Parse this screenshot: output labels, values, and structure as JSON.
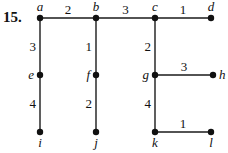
{
  "problem_number": "15.",
  "colors": {
    "stroke": "#1a1a1a",
    "node": "#111111",
    "background": "#ffffff"
  },
  "nodes": [
    {
      "id": "a",
      "label": "a",
      "x": 40,
      "y": 18,
      "label_pos": "above"
    },
    {
      "id": "b",
      "label": "b",
      "x": 96,
      "y": 18,
      "label_pos": "above"
    },
    {
      "id": "c",
      "label": "c",
      "x": 155,
      "y": 18,
      "label_pos": "above"
    },
    {
      "id": "d",
      "label": "d",
      "x": 211,
      "y": 18,
      "label_pos": "above"
    },
    {
      "id": "e",
      "label": "e",
      "x": 40,
      "y": 75,
      "label_pos": "left"
    },
    {
      "id": "f",
      "label": "f",
      "x": 96,
      "y": 75,
      "label_pos": "left"
    },
    {
      "id": "g",
      "label": "g",
      "x": 155,
      "y": 75,
      "label_pos": "left"
    },
    {
      "id": "h",
      "label": "h",
      "x": 213,
      "y": 75,
      "label_pos": "right"
    },
    {
      "id": "i",
      "label": "i",
      "x": 40,
      "y": 132,
      "label_pos": "below"
    },
    {
      "id": "j",
      "label": "j",
      "x": 96,
      "y": 132,
      "label_pos": "below"
    },
    {
      "id": "k",
      "label": "k",
      "x": 155,
      "y": 132,
      "label_pos": "below"
    },
    {
      "id": "l",
      "label": "l",
      "x": 211,
      "y": 132,
      "label_pos": "below"
    }
  ],
  "edges": [
    {
      "from": "a",
      "to": "b",
      "weight": "2"
    },
    {
      "from": "b",
      "to": "c",
      "weight": "3"
    },
    {
      "from": "c",
      "to": "d",
      "weight": "1"
    },
    {
      "from": "a",
      "to": "e",
      "weight": "3"
    },
    {
      "from": "e",
      "to": "i",
      "weight": "4"
    },
    {
      "from": "b",
      "to": "f",
      "weight": "1"
    },
    {
      "from": "f",
      "to": "j",
      "weight": "2"
    },
    {
      "from": "c",
      "to": "g",
      "weight": "2"
    },
    {
      "from": "g",
      "to": "h",
      "weight": "3"
    },
    {
      "from": "g",
      "to": "k",
      "weight": "4"
    },
    {
      "from": "k",
      "to": "l",
      "weight": "1"
    }
  ]
}
